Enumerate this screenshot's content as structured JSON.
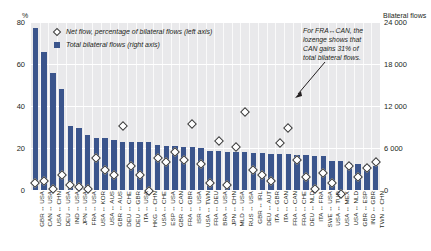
{
  "chart_data": {
    "type": "bar",
    "title": "",
    "xlabel": "",
    "ylabel": "%",
    "y2label": "Bilateral flows",
    "ylim": [
      0,
      80
    ],
    "y2lim": [
      0,
      24000
    ],
    "grid": true,
    "legend_position": "top-left",
    "yticks": [
      "0",
      "20",
      "40",
      "60",
      "80"
    ],
    "ytick_values": [
      0,
      20,
      40,
      60,
      80
    ],
    "y2ticks": [
      "0",
      "6 000",
      "12 000",
      "18 000",
      "24 000"
    ],
    "y2tick_values": [
      0,
      6000,
      12000,
      18000,
      24000
    ],
    "categories": [
      "GBR ↔ USA",
      "CAN ↔ USA",
      "USA ↔ CHN",
      "DEU ↔ USA",
      "IND ↔ USA",
      "JPN ↔ USA",
      "FRA ↔ USA",
      "USA ↔ KOR",
      "USA ↔ AUS",
      "GBR ↔ AUS",
      "DEU ↔ CHE",
      "DEU ↔ GBR",
      "ITA ↔ USA",
      "HKG ↔ CHN",
      "USA ↔ CHE",
      "ESP ↔ USA",
      "GBR ↔ CAN",
      "FRA ↔ GBR",
      "ISR ↔ USA",
      "USA ↔ TWN",
      "FRA ↔ DEU",
      "BRA ↔ USA",
      "JPN ↔ CHN",
      "MLD ↔ USA",
      "RUS ↔ USA",
      "GBR ↔ IRL",
      "DEU ↔ AUT",
      "ITA ↔ GBR",
      "ITA ↔ CAN",
      "FRA ↔ CAN",
      "FRA ↔ CHE",
      "DEU ↔ NLD",
      "ITA ↔ FRA",
      "SWE ↔ USA",
      "USA ↔ TUR",
      "USA ↔ MEX",
      "USA ↔ NLD",
      "GBR ↔ ESP",
      "IND ↔ GBR",
      "TWN ↔ CHN"
    ],
    "series": [
      {
        "name": "Total bilateral flows (right axis)",
        "axis": "right",
        "type": "bar",
        "color": "#3b558c",
        "values": [
          23100,
          19700,
          16700,
          14400,
          9200,
          8800,
          7900,
          7500,
          7400,
          7200,
          6900,
          6900,
          6800,
          6800,
          6400,
          6300,
          6300,
          6100,
          6100,
          6000,
          5600,
          5600,
          5500,
          5500,
          5400,
          5300,
          5300,
          5200,
          5100,
          5100,
          5000,
          5000,
          4900,
          4900,
          4200,
          4100,
          3800,
          3700,
          3600,
          3500
        ]
      },
      {
        "name": "Net flow, percentage of bilateral flows (left axis)",
        "axis": "left",
        "type": "scatter",
        "marker": "lozenge",
        "values": [
          5,
          6,
          2,
          9,
          4,
          3,
          2,
          17,
          11,
          9,
          32,
          13,
          9,
          1,
          17,
          15,
          20,
          16,
          33,
          14,
          5,
          25,
          4,
          22,
          39,
          11,
          9,
          6,
          24,
          31,
          16,
          8,
          2,
          10,
          5,
          0,
          13,
          8,
          12,
          15
        ]
      }
    ],
    "annotation": {
      "text": "For FRA↔CAN, the lozenge shows that CAN gains 31% of total bilateral flows.",
      "target_category": "FRA ↔ CAN"
    }
  },
  "legend": {
    "items": [
      {
        "marker": "lozenge",
        "label": "Net flow, percentage of bilateral flows (left axis)"
      },
      {
        "marker": "square",
        "label": "Total bilateral flows (right axis)"
      }
    ]
  },
  "axes": {
    "left_unit": "%",
    "right_unit": "Bilateral flows"
  },
  "colors": {
    "bar": "#3b558c",
    "plot_background": "#e9e9eb",
    "gridline": "#ffffff",
    "marker_fill": "#ffffff",
    "marker_stroke": "#3a3a3a",
    "text": "#231f20"
  }
}
